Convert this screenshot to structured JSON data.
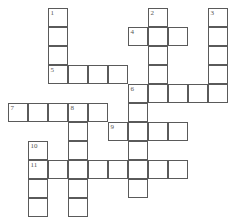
{
  "puzzle": {
    "type": "crossword",
    "grid": {
      "origin_x": 8,
      "origin_y": 8,
      "cell_w": 20,
      "cell_h": 19,
      "cols": 11,
      "rows": 11
    },
    "line_color": "#5a5a5a",
    "number_color": "#555555",
    "clues": [
      {
        "number": "1",
        "direction": "down",
        "col": 2,
        "row": 0,
        "length": 4
      },
      {
        "number": "2",
        "direction": "down",
        "col": 7,
        "row": 0,
        "length": 5
      },
      {
        "number": "3",
        "direction": "down",
        "col": 10,
        "row": 0,
        "length": 5
      },
      {
        "number": "4",
        "direction": "across",
        "col": 6,
        "row": 1,
        "length": 3
      },
      {
        "number": "5",
        "direction": "across",
        "col": 2,
        "row": 3,
        "length": 4
      },
      {
        "number": "6",
        "direction": "across",
        "col": 6,
        "row": 4,
        "length": 5
      },
      {
        "number": "6",
        "direction": "down",
        "col": 6,
        "row": 4,
        "length": 6
      },
      {
        "number": "7",
        "direction": "across",
        "col": 0,
        "row": 5,
        "length": 5
      },
      {
        "number": "8",
        "direction": "down",
        "col": 3,
        "row": 5,
        "length": 6
      },
      {
        "number": "9",
        "direction": "across",
        "col": 5,
        "row": 6,
        "length": 4
      },
      {
        "number": "10",
        "direction": "down",
        "col": 1,
        "row": 7,
        "length": 4
      },
      {
        "number": "11",
        "direction": "across",
        "col": 1,
        "row": 8,
        "length": 8
      }
    ],
    "numbered_cells": [
      {
        "label": "1",
        "col": 2,
        "row": 0
      },
      {
        "label": "2",
        "col": 7,
        "row": 0
      },
      {
        "label": "3",
        "col": 10,
        "row": 0
      },
      {
        "label": "4",
        "col": 6,
        "row": 1
      },
      {
        "label": "5",
        "col": 2,
        "row": 3
      },
      {
        "label": "6",
        "col": 6,
        "row": 4
      },
      {
        "label": "7",
        "col": 0,
        "row": 5
      },
      {
        "label": "8",
        "col": 3,
        "row": 5
      },
      {
        "label": "9",
        "col": 5,
        "row": 6
      },
      {
        "label": "10",
        "col": 1,
        "row": 7
      },
      {
        "label": "11",
        "col": 1,
        "row": 8
      }
    ],
    "entries": {}
  }
}
